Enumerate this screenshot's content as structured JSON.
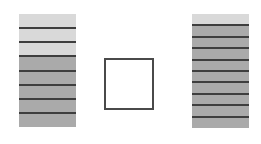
{
  "figure": {
    "left_stack": {
      "layers": 8,
      "light_layers": 3,
      "colors": {
        "light": "#d9d9d9",
        "dark": "#aaaaaa",
        "line": "#3e3e3e"
      }
    },
    "center_box": {
      "fill": "#ffffff",
      "stroke": "#4a4a4a"
    },
    "right_stack": {
      "layers": 10,
      "light_layers": 1,
      "colors": {
        "light": "#d9d9d9",
        "dark": "#aaaaaa",
        "line": "#3e3e3e"
      }
    }
  }
}
